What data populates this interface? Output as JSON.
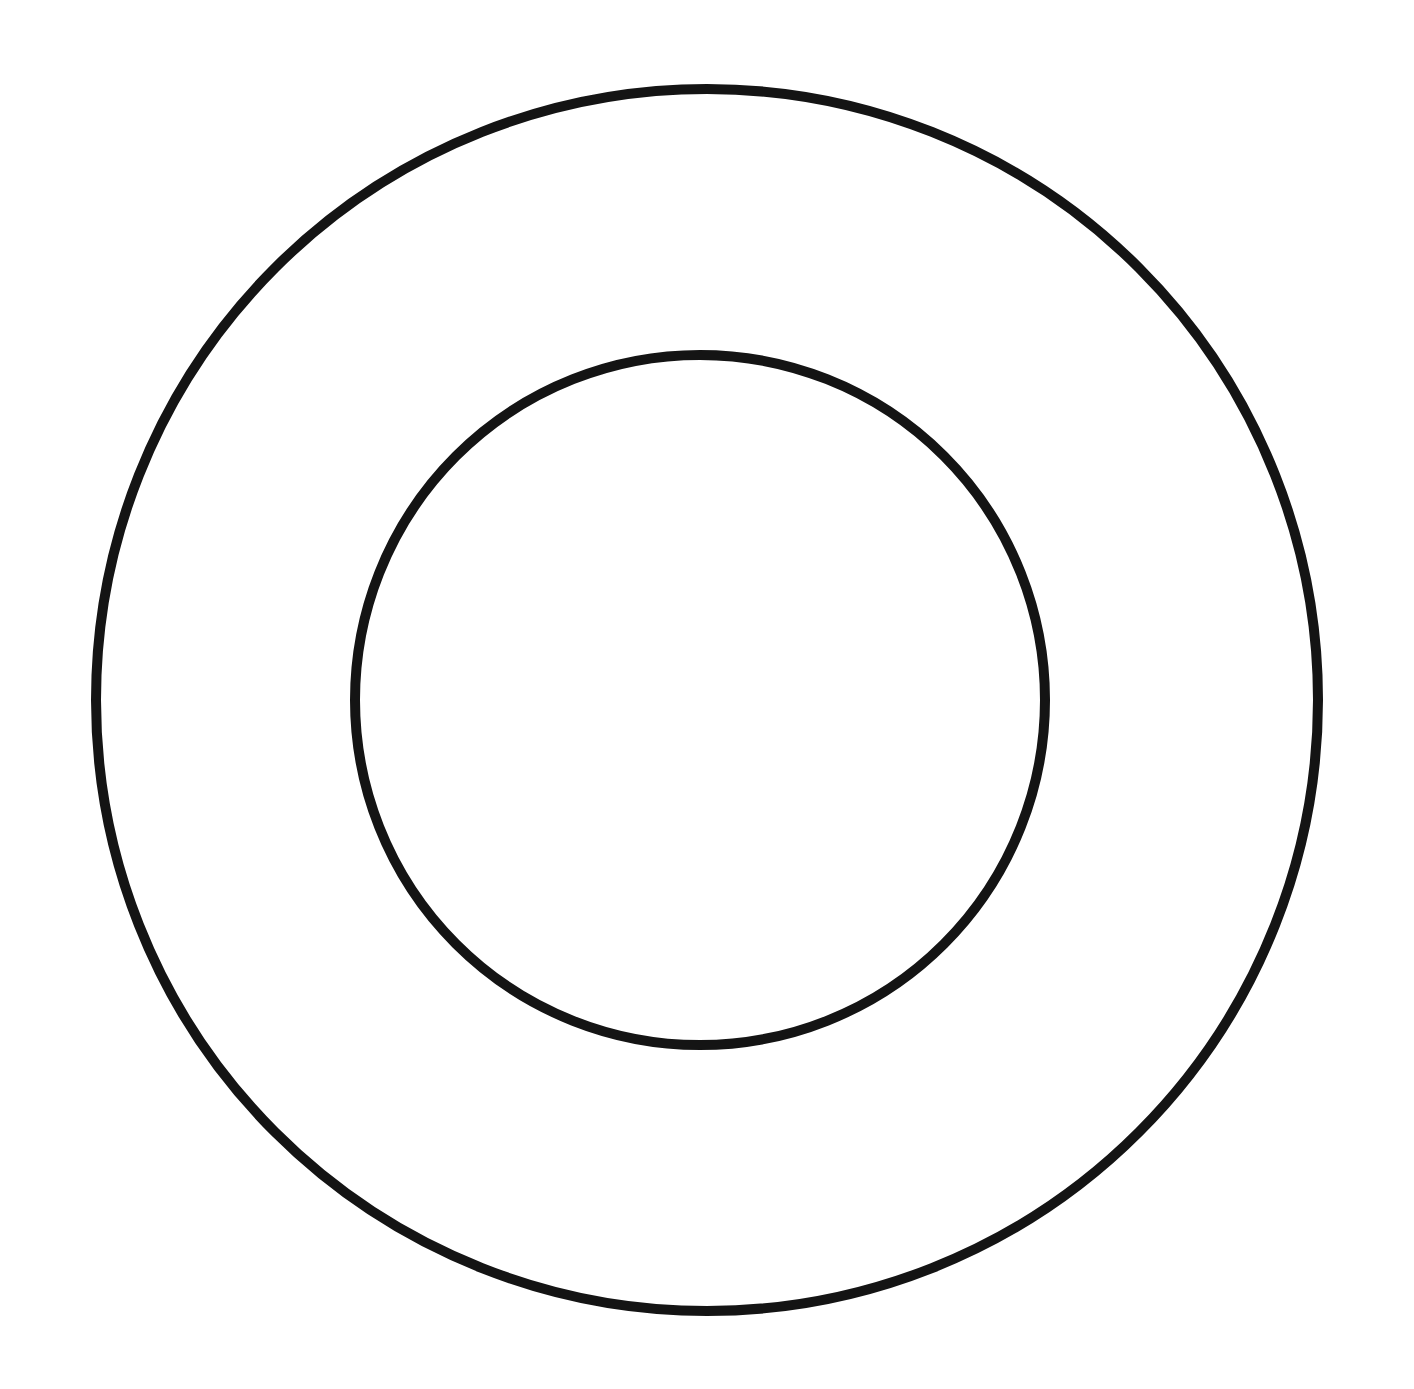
{
  "diagram": {
    "type": "concentric-circles",
    "background": "#ffffff",
    "stroke_color": "#141414",
    "stroke_width": 10,
    "circles": [
      {
        "name": "outer-circle",
        "cx": 707,
        "cy": 700,
        "r": 611
      },
      {
        "name": "inner-circle",
        "cx": 700,
        "cy": 700,
        "r": 345
      }
    ]
  }
}
